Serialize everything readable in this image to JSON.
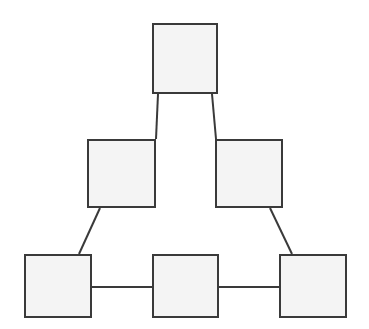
{
  "diagram": {
    "background_color": "#ffffff",
    "node_fill_color": "#f4f4f4",
    "node_border_color": "#3a3a3a",
    "edge_color": "#3a3a3a",
    "node_border_width": 2,
    "edge_width": 2,
    "canvas": {
      "width": 369,
      "height": 329
    },
    "nodes": [
      {
        "id": "top",
        "label": "",
        "x": 152,
        "y": 23,
        "width": 66,
        "height": 71
      },
      {
        "id": "middle-left",
        "label": "",
        "x": 87,
        "y": 139,
        "width": 69,
        "height": 69
      },
      {
        "id": "middle-right",
        "label": "",
        "x": 215,
        "y": 139,
        "width": 68,
        "height": 69
      },
      {
        "id": "bottom-left",
        "label": "",
        "x": 24,
        "y": 254,
        "width": 68,
        "height": 64
      },
      {
        "id": "bottom-middle",
        "label": "",
        "x": 152,
        "y": 254,
        "width": 67,
        "height": 64
      },
      {
        "id": "bottom-right",
        "label": "",
        "x": 279,
        "y": 254,
        "width": 68,
        "height": 64
      }
    ],
    "edges": [
      {
        "id": "top-to-middle-left",
        "from": "top",
        "to": "middle-left",
        "type": "diagonal",
        "x1": 158,
        "y1": 94,
        "x2": 156,
        "y2": 139
      },
      {
        "id": "top-to-middle-right",
        "from": "top",
        "to": "middle-right",
        "type": "diagonal",
        "x1": 212,
        "y1": 94,
        "x2": 216,
        "y2": 139
      },
      {
        "id": "middle-left-to-bottom-left",
        "from": "middle-left",
        "to": "bottom-left",
        "type": "diagonal",
        "x1": 100,
        "y1": 208,
        "x2": 79,
        "y2": 254
      },
      {
        "id": "middle-right-to-bottom-right",
        "from": "middle-right",
        "to": "bottom-right",
        "type": "diagonal",
        "x1": 270,
        "y1": 208,
        "x2": 292,
        "y2": 254
      },
      {
        "id": "bottom-left-to-bottom-middle",
        "from": "bottom-left",
        "to": "bottom-middle",
        "type": "horizontal",
        "x1": 92,
        "y1": 287,
        "x2": 152,
        "y2": 287
      },
      {
        "id": "bottom-middle-to-bottom-right",
        "from": "bottom-middle",
        "to": "bottom-right",
        "type": "horizontal",
        "x1": 219,
        "y1": 287,
        "x2": 279,
        "y2": 287
      }
    ]
  }
}
